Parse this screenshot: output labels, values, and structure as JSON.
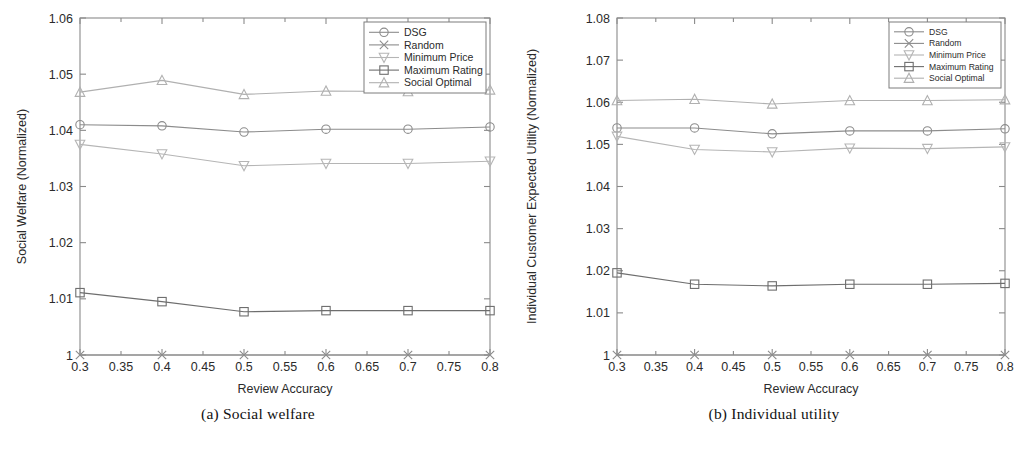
{
  "figure": {
    "panels": [
      {
        "id": "panel-a",
        "caption": "(a)  Social welfare"
      },
      {
        "id": "panel-b",
        "caption": "(b)  Individual utility"
      }
    ]
  },
  "chart_data": [
    {
      "type": "line",
      "title": "",
      "subtitle": "",
      "xlabel": "Review Accuracy",
      "ylabel": "Social Welfare (Normalized)",
      "x": [
        0.3,
        0.4,
        0.5,
        0.6,
        0.7,
        0.8
      ],
      "xlim": [
        0.3,
        0.8
      ],
      "ylim": [
        1,
        1.06
      ],
      "xticks": [
        0.3,
        0.35,
        0.4,
        0.45,
        0.5,
        0.55,
        0.6,
        0.65,
        0.7,
        0.75,
        0.8
      ],
      "xticklabels": [
        "0.3",
        "0.35",
        "0.4",
        "0.45",
        "0.5",
        "0.55",
        "0.6",
        "0.65",
        "0.7",
        "0.75",
        "0.8"
      ],
      "yticks": [
        1,
        1.01,
        1.02,
        1.03,
        1.04,
        1.05,
        1.06
      ],
      "yticklabels": [
        "1",
        "1.01",
        "1.02",
        "1.03",
        "1.04",
        "1.05",
        "1.06"
      ],
      "grid": false,
      "legend_position": "upper right",
      "series": [
        {
          "name": "DSG",
          "marker": "circle",
          "color": "#8c8c8c",
          "values": [
            1.041,
            1.0408,
            1.0397,
            1.0402,
            1.0402,
            1.0406
          ]
        },
        {
          "name": "Random",
          "marker": "x",
          "color": "#8c8c8c",
          "values": [
            1.0,
            1.0,
            1.0,
            1.0,
            1.0,
            1.0
          ]
        },
        {
          "name": "Minimum Price",
          "marker": "triangle-down",
          "color": "#b5b5b5",
          "values": [
            1.0375,
            1.0358,
            1.0337,
            1.0341,
            1.0341,
            1.0345
          ]
        },
        {
          "name": "Maximum Rating",
          "marker": "square",
          "color": "#6e6e6e",
          "values": [
            1.0111,
            1.0095,
            1.0077,
            1.0079,
            1.0079,
            1.0079
          ]
        },
        {
          "name": "Social Optimal",
          "marker": "triangle-up",
          "color": "#b0b0b0",
          "values": [
            1.0468,
            1.0489,
            1.0464,
            1.047,
            1.0469,
            1.0472
          ]
        }
      ]
    },
    {
      "type": "line",
      "title": "",
      "subtitle": "",
      "xlabel": "Review Accuracy",
      "ylabel": "Individual Customer Expected Utility (Normalized)",
      "x": [
        0.3,
        0.4,
        0.5,
        0.6,
        0.7,
        0.8
      ],
      "xlim": [
        0.3,
        0.8
      ],
      "ylim": [
        1,
        1.08
      ],
      "xticks": [
        0.3,
        0.35,
        0.4,
        0.45,
        0.5,
        0.55,
        0.6,
        0.65,
        0.7,
        0.75,
        0.8
      ],
      "xticklabels": [
        "0.3",
        "0.35",
        "0.4",
        "0.45",
        "0.5",
        "0.55",
        "0.6",
        "0.65",
        "0.7",
        "0.75",
        "0.8"
      ],
      "yticks": [
        1,
        1.01,
        1.02,
        1.03,
        1.04,
        1.05,
        1.06,
        1.07,
        1.08
      ],
      "yticklabels": [
        "1",
        "1.01",
        "1.02",
        "1.03",
        "1.04",
        "1.05",
        "1.06",
        "1.07",
        "1.08"
      ],
      "grid": false,
      "legend_position": "upper right",
      "series": [
        {
          "name": "DSG",
          "marker": "circle",
          "color": "#8c8c8c",
          "values": [
            1.0539,
            1.0539,
            1.0525,
            1.0532,
            1.0532,
            1.0537
          ]
        },
        {
          "name": "Random",
          "marker": "x",
          "color": "#8c8c8c",
          "values": [
            1.0,
            1.0,
            1.0,
            1.0,
            1.0,
            1.0
          ]
        },
        {
          "name": "Minimum Price",
          "marker": "triangle-down",
          "color": "#b5b5b5",
          "values": [
            1.0519,
            1.0488,
            1.0482,
            1.0491,
            1.049,
            1.0494
          ]
        },
        {
          "name": "Maximum Rating",
          "marker": "square",
          "color": "#6e6e6e",
          "values": [
            1.0195,
            1.0168,
            1.0164,
            1.0168,
            1.0168,
            1.017
          ]
        },
        {
          "name": "Social Optimal",
          "marker": "triangle-up",
          "color": "#b0b0b0",
          "values": [
            1.0604,
            1.0607,
            1.0596,
            1.0604,
            1.0604,
            1.0606
          ]
        }
      ]
    }
  ],
  "colors": {
    "axis": "#8a8a8a",
    "text": "#2b2b2b",
    "legend_border": "#7d7d7d",
    "background": "#ffffff"
  }
}
